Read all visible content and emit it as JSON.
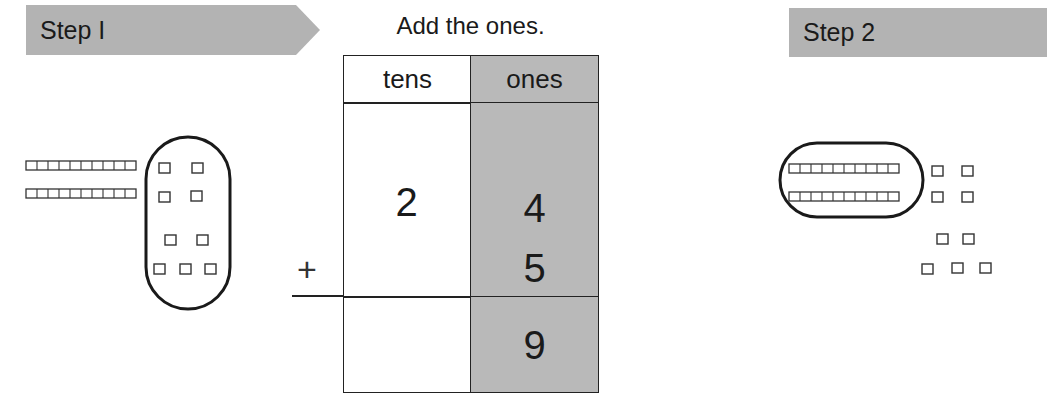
{
  "step1": {
    "label": "Step I"
  },
  "step2": {
    "label": "Step 2"
  },
  "instruction": "Add the ones.",
  "place_value_table": {
    "headers": {
      "tens": "tens",
      "ones": "ones"
    },
    "addend1": {
      "tens": "2",
      "ones": "4"
    },
    "addend2": {
      "tens": "",
      "ones": "5"
    },
    "sum": {
      "tens": "",
      "ones": "9"
    },
    "operator": "+"
  },
  "colors": {
    "banner": "#b3b3b3",
    "ones_column": "#b9b9b9",
    "line": "#222222"
  },
  "step1_model": {
    "tens_rods": 2,
    "ones_cubes": 9,
    "circled": "ones"
  },
  "step2_model": {
    "tens_rods": 2,
    "ones_cubes": 9,
    "circled": "tens"
  }
}
